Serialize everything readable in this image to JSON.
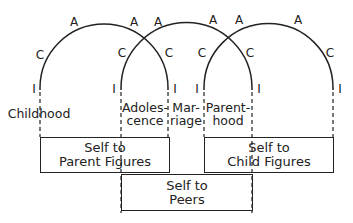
{
  "diagram": {
    "arcs": [
      {
        "id": "arc-1",
        "letters": {
          "left_I": "I",
          "left_C": "C",
          "left_A": "A",
          "right_A": "A",
          "right_C": "C",
          "right_I": "I"
        }
      },
      {
        "id": "arc-2",
        "letters": {
          "left_I": "I",
          "left_C": "C",
          "left_A": "A",
          "right_A": "A",
          "right_C": "C",
          "right_I": "I"
        }
      },
      {
        "id": "arc-3",
        "letters": {
          "left_I": "I",
          "left_C": "C",
          "left_A": "A",
          "right_A": "A",
          "right_C": "C",
          "right_I": "I"
        }
      }
    ],
    "stages": [
      {
        "line1": "Childhood",
        "line2": ""
      },
      {
        "line1": "Adoles-",
        "line2": "cence"
      },
      {
        "line1": "Mar-",
        "line2": "riage"
      },
      {
        "line1": "Parent-",
        "line2": "hood"
      }
    ],
    "boxes": [
      {
        "line1": "Self to",
        "line2": "Parent Figures"
      },
      {
        "line1": "Self to",
        "line2": "Child Figures"
      },
      {
        "line1": "Self to",
        "line2": "Peers"
      }
    ]
  }
}
